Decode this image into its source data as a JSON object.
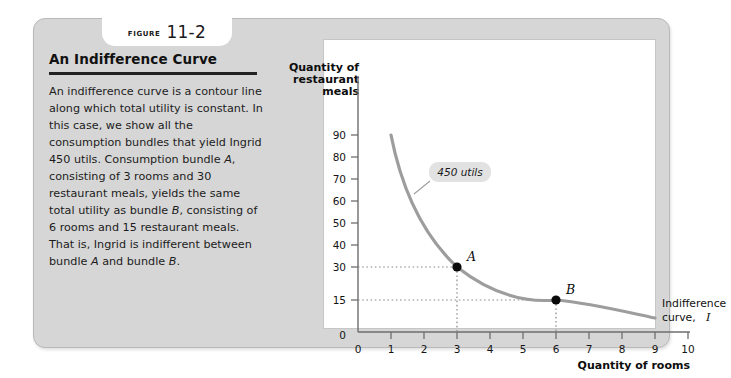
{
  "figure": {
    "tab_word": "Figure",
    "tab_number": "11-2",
    "title": "An Indifference Curve",
    "caption": "An indifference curve is a contour line along which total utility is constant. In this case, we show all the consumption bundles that yield Ingrid 450 utils. Consumption bundle A, consisting of 3 rooms and 30 restaurant meals, yields the same total utility as bundle B, consisting of 6 rooms and 15 restaurant meals. That is, Ingrid is indifferent between bundle A and bundle B."
  },
  "chart_data": {
    "type": "line",
    "title": "",
    "xlabel": "Quantity of rooms",
    "ylabel": "Quantity of restaurant meals",
    "ylabel_lines": [
      "Quantity of",
      "restaurant",
      "meals"
    ],
    "xlim": [
      0,
      10
    ],
    "ylim": [
      0,
      97
    ],
    "xticks": [
      0,
      1,
      2,
      3,
      4,
      5,
      6,
      7,
      8,
      9,
      10
    ],
    "xtick_labels": [
      "0",
      "1",
      "2",
      "3",
      "4",
      "5",
      "6",
      "7",
      "8",
      "9",
      "10"
    ],
    "yticks": [
      0,
      15,
      30,
      40,
      50,
      60,
      70,
      80,
      90
    ],
    "ytick_labels": [
      "0",
      "15",
      "30",
      "40",
      "50",
      "60",
      "70",
      "80",
      "90"
    ],
    "grid": false,
    "legend": "none",
    "series": [
      {
        "name": "Indifference curve, I",
        "utility_level": 450,
        "x": [
          1.0,
          1.25,
          1.5,
          1.75,
          2.0,
          2.5,
          3.0,
          3.5,
          4.0,
          4.5,
          5.0,
          5.5,
          6.0,
          6.5,
          7.0,
          7.5,
          8.0,
          8.5,
          9.0
        ],
        "y": [
          90,
          72,
          60,
          51.4,
          45,
          36,
          30,
          25.7,
          22.5,
          20,
          18,
          16.4,
          15,
          13.8,
          12.9,
          12,
          11.3,
          10.6,
          10
        ]
      }
    ],
    "annotations": [
      {
        "name": "utils-callout",
        "text": "450 utils",
        "x": 2.0,
        "y": 62
      },
      {
        "name": "curve-label-line1",
        "text": "Indifference",
        "x": 9.4,
        "y": 22
      },
      {
        "name": "curve-label-line2",
        "text": "curve,",
        "x": 9.4,
        "y": 15
      },
      {
        "name": "curve-label-italic",
        "text": "I",
        "x": 10.4,
        "y": 15
      }
    ],
    "points": [
      {
        "label": "A",
        "x": 3,
        "y": 30,
        "rooms": 3,
        "meals": 30
      },
      {
        "label": "B",
        "x": 6,
        "y": 15,
        "rooms": 6,
        "meals": 15
      }
    ]
  }
}
